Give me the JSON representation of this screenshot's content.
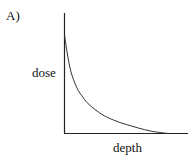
{
  "figure": {
    "panel_label": "A)"
  },
  "chart_data": {
    "type": "line",
    "title": "",
    "panel_label": "A)",
    "xlabel": "depth",
    "ylabel": "dose",
    "grid": false,
    "legend": null,
    "ticks": {
      "x": [],
      "y": []
    },
    "axis_ranges_normalized": {
      "x": [
        0,
        1
      ],
      "y": [
        0,
        1
      ]
    },
    "series": [
      {
        "name": "dose vs depth",
        "description": "Monotonically decreasing, steep initial drop then gradual decay toward zero",
        "x": [
          0.0,
          0.02,
          0.05,
          0.1,
          0.15,
          0.2,
          0.3,
          0.4,
          0.5,
          0.6,
          0.7,
          0.8,
          0.84
        ],
        "y": [
          0.82,
          0.68,
          0.52,
          0.38,
          0.3,
          0.24,
          0.16,
          0.11,
          0.075,
          0.045,
          0.02,
          0.005,
          0.0
        ]
      }
    ],
    "colors": {
      "axis": "#222222",
      "curve": "#333333",
      "text": "#111111"
    }
  }
}
